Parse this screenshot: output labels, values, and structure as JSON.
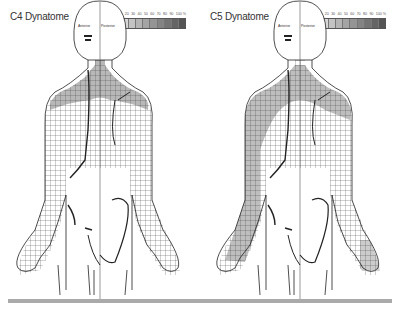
{
  "panels": [
    {
      "title": "C4 Dynatome",
      "head_labels": {
        "anterior": "Anterior",
        "posterior": "Posterior"
      },
      "legend": {
        "ticks": [
          "0",
          "10",
          "20",
          "30",
          "40",
          "50",
          "60",
          "70",
          "80",
          "90",
          "100 %"
        ],
        "colors": [
          "#e8e8e8",
          "#d6d6d6",
          "#c4c4c4",
          "#b4b4b4",
          "#a4a4a4",
          "#949494",
          "#848484",
          "#747474",
          "#646464",
          "#545454"
        ]
      },
      "shading": "neck-shoulders"
    },
    {
      "title": "C5 Dynatome",
      "head_labels": {
        "anterior": "Anterior",
        "posterior": "Posterior"
      },
      "legend": {
        "ticks": [
          "0",
          "10",
          "20",
          "30",
          "40",
          "50",
          "60",
          "70",
          "80",
          "90",
          "100 %"
        ],
        "colors": [
          "#e8e8e8",
          "#d6d6d6",
          "#c4c4c4",
          "#b4b4b4",
          "#a4a4a4",
          "#949494",
          "#848484",
          "#747474",
          "#646464",
          "#545454"
        ]
      },
      "shading": "shoulders-arms"
    }
  ]
}
